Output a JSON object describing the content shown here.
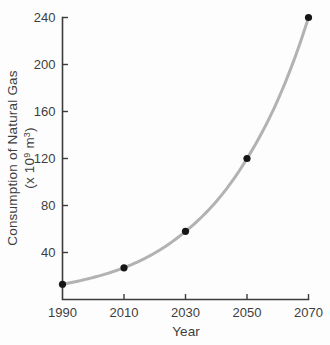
{
  "chart_data": {
    "type": "line",
    "title": "",
    "x": [
      1990,
      2010,
      2030,
      2050,
      2070
    ],
    "series": [
      {
        "name": "Consumption of Natural Gas",
        "values": [
          13,
          27,
          58,
          120,
          240
        ]
      }
    ],
    "xlabel": "Year",
    "ylabel": "Consumption of Natural Gas (x 10⁹ m³)",
    "ylabel_line1": "Consumption of Natural Gas",
    "ylabel_line2_parts": {
      "open": "(x 10",
      "exp": "9",
      "mid": " m",
      "exp2": "3",
      "close": ")"
    },
    "xlim": [
      1990,
      2070
    ],
    "ylim": [
      0,
      240
    ],
    "xticks": [
      1990,
      2010,
      2030,
      2050,
      2070
    ],
    "yticks": [
      40,
      80,
      120,
      160,
      200,
      240
    ],
    "grid": false,
    "legend_position": "none",
    "marker": "filled-circle",
    "curve_shape": "smooth-exponential",
    "colors": {
      "curve": "#b2b2b2",
      "point": "#161616",
      "axis": "#3c3c3c",
      "text": "#3d3d3d",
      "background": "#fdfdfd"
    }
  }
}
